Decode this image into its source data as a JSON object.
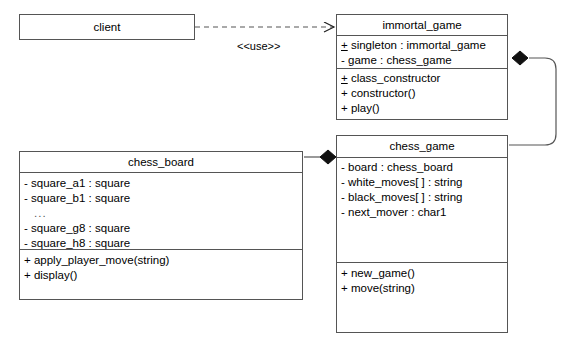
{
  "diagram": {
    "stroke_color": "#555555",
    "fill_color": "#ffffff",
    "text_color": "#000000"
  },
  "classes": {
    "client": {
      "name": "client",
      "attributes": [],
      "operations": []
    },
    "immortal_game": {
      "name": "immortal_game",
      "attributes": [
        {
          "visibility": "+",
          "static": true,
          "text": "singleton : immortal_game"
        },
        {
          "visibility": "-",
          "static": false,
          "text": "game : chess_game"
        }
      ],
      "operations": [
        {
          "visibility": "+",
          "static": true,
          "text": "class_constructor"
        },
        {
          "visibility": "+",
          "static": false,
          "text": "constructor()"
        },
        {
          "visibility": "+",
          "static": false,
          "text": "play()"
        }
      ]
    },
    "chess_board": {
      "name": "chess_board",
      "attributes": [
        {
          "visibility": "-",
          "static": false,
          "text": "square_a1 : square"
        },
        {
          "visibility": "-",
          "static": false,
          "text": "square_b1 : square"
        },
        {
          "visibility": "",
          "static": false,
          "text": "..."
        },
        {
          "visibility": "-",
          "static": false,
          "text": "square_g8 : square"
        },
        {
          "visibility": "-",
          "static": false,
          "text": "square_h8 : square"
        }
      ],
      "operations": [
        {
          "visibility": "+",
          "static": false,
          "text": "apply_player_move(string)"
        },
        {
          "visibility": "+",
          "static": false,
          "text": "display()"
        }
      ]
    },
    "chess_game": {
      "name": "chess_game",
      "attributes": [
        {
          "visibility": "-",
          "static": false,
          "text": "board : chess_board"
        },
        {
          "visibility": "-",
          "static": false,
          "text": "white_moves[ ] : string"
        },
        {
          "visibility": "-",
          "static": false,
          "text": "black_moves[ ] : string"
        },
        {
          "visibility": "-",
          "static": false,
          "text": "next_mover : char1"
        }
      ],
      "operations": [
        {
          "visibility": "+",
          "static": false,
          "text": "new_game()"
        },
        {
          "visibility": "+",
          "static": false,
          "text": "move(string)"
        }
      ]
    }
  },
  "relationships": {
    "use_dependency": {
      "label": "<<use>>",
      "from": "client",
      "to": "immortal_game",
      "kind": "dependency"
    },
    "immortal_owns_game": {
      "label": "",
      "from": "immortal_game",
      "to": "chess_game",
      "kind": "composition"
    },
    "game_owns_board": {
      "label": "",
      "from": "chess_game",
      "to": "chess_board",
      "kind": "composition"
    }
  }
}
